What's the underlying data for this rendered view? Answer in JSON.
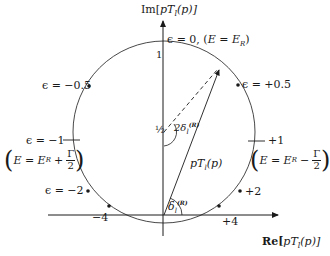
{
  "diagram": {
    "type": "argand-unitarity-circle",
    "axes": {
      "y_label": "Im[pT_l(p)]",
      "y_label_parts": {
        "pre": "Im[",
        "var": "pT",
        "sub": "l",
        "post": "(p)]"
      },
      "x_label": "Re[pT_l(p)]",
      "x_label_parts": {
        "pre": "Re[",
        "var": "pT",
        "sub": "l",
        "post": "(p)]"
      },
      "top_tick": "1",
      "center_tick": "½"
    },
    "points": [
      {
        "id": "eps0",
        "label": "ε = 0, (E = E_R)",
        "label_main": "ϵ = 0, (",
        "label_eq": "E = E",
        "label_sub": "R",
        "label_end": ")"
      },
      {
        "id": "epsm05",
        "label": "ϵ = −0.5"
      },
      {
        "id": "epsp05",
        "label": "ϵ = +0.5"
      },
      {
        "id": "epsm1",
        "label": "ϵ = −1"
      },
      {
        "id": "epsp1",
        "label": "+1"
      },
      {
        "id": "epsm2",
        "label": "ϵ = −2"
      },
      {
        "id": "epsp2",
        "label": "+2"
      },
      {
        "id": "epsm4",
        "label": "−4"
      },
      {
        "id": "epsp4",
        "label": "+4"
      }
    ],
    "annotations": {
      "left_energy": {
        "lhs": "E = E",
        "sub": "R",
        "op": "+",
        "num": "Γ",
        "den": "2"
      },
      "right_energy": {
        "lhs": "E = E",
        "sub": "R",
        "op": "−",
        "num": "Γ",
        "den": "2"
      },
      "vector_label": {
        "var": "pT",
        "sub": "l",
        "post": "(p)"
      },
      "angle_small": {
        "sym": "δ",
        "sub": "l",
        "sup": "(R)"
      },
      "angle_double": {
        "pre": "2δ",
        "sub": "l",
        "sup": "(R)"
      }
    },
    "colors": {
      "ink": "#1a1a1a",
      "background": "#ffffff"
    }
  }
}
